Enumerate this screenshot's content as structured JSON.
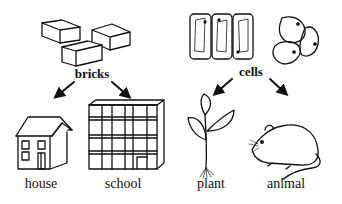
{
  "diagram": {
    "type": "analogy-hierarchy",
    "colors": {
      "ink": "#111111",
      "background": "#ffffff"
    },
    "left_branch": {
      "parent": {
        "label": "bricks",
        "icon": "bricks-icon"
      },
      "children": [
        {
          "label": "house",
          "icon": "house-icon"
        },
        {
          "label": "school",
          "icon": "school-building-icon"
        }
      ]
    },
    "right_branch": {
      "parent": {
        "label": "cells",
        "icon": "cells-icon"
      },
      "children": [
        {
          "label": "plant",
          "icon": "plant-icon"
        },
        {
          "label": "animal",
          "icon": "mouse-icon"
        }
      ]
    }
  }
}
